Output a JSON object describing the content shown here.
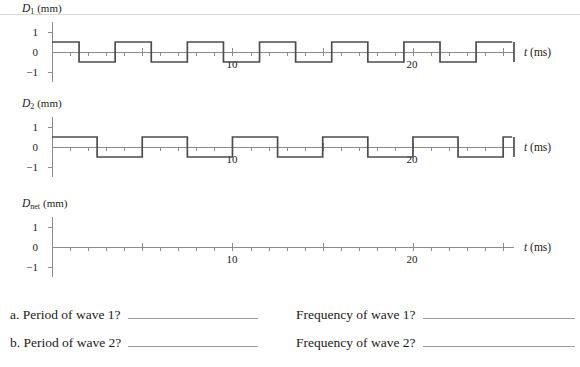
{
  "graphs": [
    {
      "id": "d1",
      "ylabel_symbol": "D",
      "ylabel_subscript": "1",
      "ylabel_unit": "(mm)",
      "axis_label": "t (ms)",
      "axis_label_italic": "t",
      "axis_label_unit": "(ms)",
      "y_ticks": [
        "1",
        "0",
        "−1"
      ],
      "x_tick_labels": [
        "10",
        "20"
      ],
      "x_tick_values": [
        10,
        20
      ]
    },
    {
      "id": "d2",
      "ylabel_symbol": "D",
      "ylabel_subscript": "2",
      "ylabel_unit": "(mm)",
      "axis_label": "t (ms)",
      "axis_label_italic": "t",
      "axis_label_unit": "(ms)",
      "y_ticks": [
        "1",
        "0",
        "−1"
      ],
      "x_tick_labels": [
        "10",
        "20"
      ],
      "x_tick_values": [
        10,
        20
      ]
    },
    {
      "id": "dnet",
      "ylabel_symbol": "D",
      "ylabel_subscript": "net",
      "ylabel_unit": "(mm)",
      "axis_label": "t (ms)",
      "axis_label_italic": "t",
      "axis_label_unit": "(ms)",
      "y_ticks": [
        "1",
        "0",
        "−1"
      ],
      "x_tick_labels": [
        "10",
        "20"
      ],
      "x_tick_values": [
        10,
        20
      ]
    }
  ],
  "chart_data": [
    {
      "type": "line",
      "title": "D1 (mm)",
      "xlabel": "t (ms)",
      "ylabel": "D1 (mm)",
      "xlim": [
        0,
        25.6
      ],
      "ylim": [
        -1,
        1
      ],
      "grid": false,
      "legend": "none",
      "waveform": "square",
      "period_ms": 4,
      "amplitude_mm": 0.5,
      "phase": "starts high at t = 0",
      "x_tick_interval_ms": 1,
      "x_labeled_ticks": [
        10,
        20
      ],
      "y_ticks": [
        -1,
        0,
        1
      ],
      "series": [
        {
          "name": "D1",
          "x": [
            0,
            1.5,
            1.5,
            3.5,
            3.5,
            5.5,
            5.5,
            7.5,
            7.5,
            9.5,
            9.5,
            11.5,
            11.5,
            13.5,
            13.5,
            15.5,
            15.5,
            17.5,
            17.5,
            19.5,
            19.5,
            21.5,
            21.5,
            23.5,
            23.5,
            25.5
          ],
          "values": [
            0.5,
            0.5,
            -0.5,
            -0.5,
            0.5,
            0.5,
            -0.5,
            -0.5,
            0.5,
            0.5,
            -0.5,
            -0.5,
            0.5,
            0.5,
            -0.5,
            -0.5,
            0.5,
            0.5,
            -0.5,
            -0.5,
            0.5,
            0.5,
            -0.5,
            -0.5,
            0.5,
            0.5
          ]
        }
      ]
    },
    {
      "type": "line",
      "title": "D2 (mm)",
      "xlabel": "t (ms)",
      "ylabel": "D2 (mm)",
      "xlim": [
        0,
        25.6
      ],
      "ylim": [
        -1,
        1
      ],
      "grid": false,
      "legend": "none",
      "waveform": "square",
      "period_ms": 5,
      "amplitude_mm": 0.5,
      "phase": "starts high at t = 0",
      "x_tick_interval_ms": 1,
      "x_labeled_ticks": [
        10,
        20
      ],
      "y_ticks": [
        -1,
        0,
        1
      ],
      "series": [
        {
          "name": "D2",
          "x": [
            0,
            2.5,
            2.5,
            5,
            5,
            7.5,
            7.5,
            10,
            10,
            12.5,
            12.5,
            15,
            15,
            17.5,
            17.5,
            20,
            20,
            22.5,
            22.5,
            25,
            25,
            25.5
          ],
          "values": [
            0.5,
            0.5,
            -0.5,
            -0.5,
            0.5,
            0.5,
            -0.5,
            -0.5,
            0.5,
            0.5,
            -0.5,
            -0.5,
            0.5,
            0.5,
            -0.5,
            -0.5,
            0.5,
            0.5,
            -0.5,
            -0.5,
            0.5,
            0.5
          ]
        }
      ]
    },
    {
      "type": "line",
      "title": "Dnet (mm)",
      "xlabel": "t (ms)",
      "ylabel": "Dnet (mm)",
      "xlim": [
        0,
        25.6
      ],
      "ylim": [
        -1,
        1
      ],
      "grid": false,
      "legend": "none",
      "waveform": "none",
      "note": "blank axes for student to draw the superposition",
      "x_tick_interval_ms": 1,
      "x_labeled_ticks": [
        10,
        20
      ],
      "y_ticks": [
        -1,
        0,
        1
      ],
      "series": []
    }
  ],
  "questions": [
    {
      "left_label": "a. Period of wave 1?",
      "left_answer": "",
      "right_label": "Frequency of wave 1?",
      "right_answer": ""
    },
    {
      "left_label": "b. Period of wave 2?",
      "left_answer": "",
      "right_label": "Frequency of wave 2?",
      "right_answer": ""
    }
  ],
  "colors": {
    "wave_stroke": "#4d4d4d",
    "axis": "#8c8c8c",
    "text": "#1a1a1a",
    "rule": "#d9d9d9",
    "blank_line": "#9a9a9a"
  }
}
